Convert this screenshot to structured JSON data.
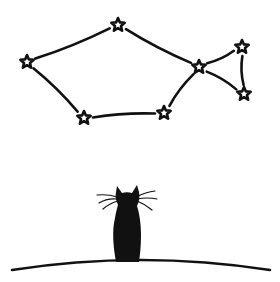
{
  "illustration": {
    "subject": "cat looking at fish-shaped constellation",
    "colors": {
      "ink": "#111111",
      "background": "#ffffff"
    },
    "constellation": {
      "name": "fish",
      "stars": [
        {
          "id": "s1",
          "x": 27,
          "y": 62
        },
        {
          "id": "s2",
          "x": 118,
          "y": 25
        },
        {
          "id": "s3",
          "x": 199,
          "y": 67
        },
        {
          "id": "s4",
          "x": 242,
          "y": 47
        },
        {
          "id": "s5",
          "x": 244,
          "y": 94
        },
        {
          "id": "s6",
          "x": 164,
          "y": 113
        },
        {
          "id": "s7",
          "x": 84,
          "y": 118
        }
      ],
      "lines": [
        [
          "s1",
          "s2"
        ],
        [
          "s2",
          "s3"
        ],
        [
          "s3",
          "s4"
        ],
        [
          "s4",
          "s5"
        ],
        [
          "s5",
          "s3"
        ],
        [
          "s3",
          "s6"
        ],
        [
          "s6",
          "s7"
        ],
        [
          "s7",
          "s1"
        ]
      ]
    },
    "cat": {
      "x": 128,
      "y_top": 186,
      "y_bottom": 262
    },
    "hill": {
      "left_x": 12,
      "right_x": 270,
      "crest_y": 260,
      "edge_y": 270
    }
  }
}
